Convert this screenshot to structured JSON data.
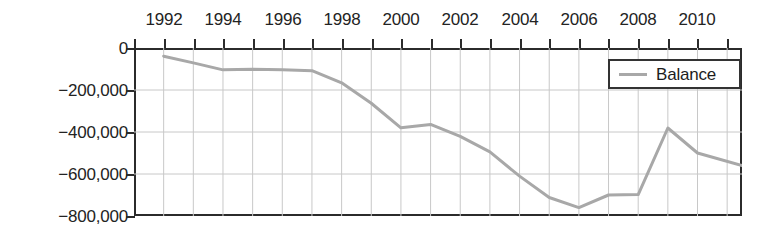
{
  "chart_data": {
    "type": "line",
    "title": "",
    "xlabel": "",
    "ylabel": "",
    "xlim": [
      1991,
      2011.5
    ],
    "ylim": [
      -800000,
      0
    ],
    "grid": true,
    "legend_position": "top-right",
    "y_ticks": [
      0,
      -200000,
      -400000,
      -600000,
      -800000
    ],
    "y_tick_labels": [
      "0",
      "−200,000",
      "−400,000",
      "−600,000",
      "−800,000"
    ],
    "x_ticks": [
      1992,
      1994,
      1996,
      1998,
      2000,
      2002,
      2004,
      2006,
      2008,
      2010
    ],
    "x_tick_labels": [
      "1992",
      "1994",
      "1996",
      "1998",
      "2000",
      "2002",
      "2004",
      "2006",
      "2008",
      "2010"
    ],
    "x_minor_ticks": [
      1991,
      1993,
      1995,
      1997,
      1999,
      2001,
      2003,
      2005,
      2007,
      2009,
      2011
    ],
    "series": [
      {
        "name": "Balance",
        "color": "#a8a8a8",
        "x": [
          1992,
          1993,
          1994,
          1995,
          1996,
          1997,
          1998,
          1999,
          2000,
          2001,
          2002,
          2003,
          2004,
          2005,
          2006,
          2007,
          2008,
          2009,
          2010,
          2011.5
        ],
        "values": [
          -39000,
          -71000,
          -104000,
          -101000,
          -104000,
          -108000,
          -166000,
          -263000,
          -380000,
          -364000,
          -421000,
          -495000,
          -610000,
          -712000,
          -760000,
          -700000,
          -698000,
          -381000,
          -500000,
          -560000
        ]
      }
    ]
  },
  "legend": {
    "entries": [
      {
        "label": "Balance",
        "color": "#a8a8a8"
      }
    ]
  },
  "colors": {
    "line": "#a8a8a8",
    "grid": "#c8c8c8",
    "axis": "#2b2b2b",
    "text": "#232323",
    "background": "#ffffff"
  }
}
